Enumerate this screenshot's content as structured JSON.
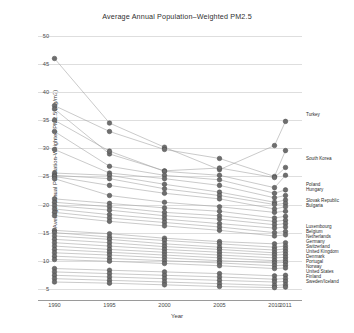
{
  "chart_data": {
    "type": "line",
    "title": "Average Annual Population–Weighted PM2.5",
    "xlabel": "Year",
    "ylabel": "Average Annual Population-Weighted PM2.5 (ug/m3)",
    "x": [
      1990,
      1995,
      2000,
      2005,
      2010,
      2011
    ],
    "xtick_labels": [
      "1990",
      "1995",
      "2000",
      "2005",
      "2010",
      "2011"
    ],
    "ytick_labels": [
      "5",
      "10",
      "15",
      "20",
      "25",
      "30",
      "35",
      "40",
      "45",
      "50"
    ],
    "ylim": [
      3,
      50
    ],
    "xlim": [
      1988.5,
      2012.5
    ],
    "grid": true,
    "legend_position": "right-inline-labels",
    "marker": "filled-circle",
    "marker_color": "#6e6e6e",
    "line_color": "#9e9e9e",
    "series": [
      {
        "name": "Turkey",
        "label": "Turkey",
        "values": [
          46.0,
          34.5,
          30.2,
          26.2,
          30.5,
          34.8
        ]
      },
      {
        "name": "South Korea",
        "label": "South Korea",
        "values": [
          37.6,
          33.0,
          29.8,
          28.2,
          25.0,
          29.6
        ]
      },
      {
        "name": "Poland",
        "label": "Poland",
        "values": [
          37.0,
          29.0,
          26.0,
          26.5,
          24.8,
          26.6
        ]
      },
      {
        "name": "Hungary",
        "label": "Hungary",
        "values": [
          35.0,
          29.5,
          25.9,
          25.2,
          23.0,
          25.2
        ]
      },
      {
        "name": "Slovak Republic",
        "label": "Slovak Republic",
        "values": [
          33.0,
          26.8,
          25.2,
          24.4,
          22.0,
          22.6
        ]
      },
      {
        "name": "Bulgaria",
        "label": "Bulgaria",
        "values": [
          29.8,
          25.6,
          24.6,
          23.4,
          21.2,
          21.6
        ]
      },
      {
        "name": "Czech Republic",
        "label": "",
        "values": [
          25.6,
          25.2,
          23.6,
          22.2,
          20.4,
          20.8
        ]
      },
      {
        "name": "Greece",
        "label": "",
        "values": [
          25.2,
          24.6,
          22.8,
          21.6,
          20.0,
          20.2
        ]
      },
      {
        "name": "Italy",
        "label": "",
        "values": [
          25.0,
          23.4,
          22.0,
          21.0,
          19.2,
          19.6
        ]
      },
      {
        "name": "Romania",
        "label": "",
        "values": [
          24.6,
          21.6,
          20.4,
          19.6,
          18.6,
          18.8
        ]
      },
      {
        "name": "Slovenia",
        "label": "",
        "values": [
          21.0,
          20.2,
          19.4,
          18.8,
          17.6,
          17.9
        ]
      },
      {
        "name": "Austria",
        "label": "",
        "values": [
          20.4,
          19.6,
          18.6,
          18.0,
          17.0,
          17.2
        ]
      },
      {
        "name": "Israel",
        "label": "",
        "values": [
          19.8,
          19.0,
          18.0,
          17.4,
          16.4,
          16.6
        ]
      },
      {
        "name": "France",
        "label": "",
        "values": [
          19.2,
          18.2,
          17.4,
          16.6,
          15.8,
          16.0
        ]
      },
      {
        "name": "Spain",
        "label": "",
        "values": [
          18.6,
          17.6,
          16.8,
          16.0,
          15.0,
          15.2
        ]
      },
      {
        "name": "Chile",
        "label": "",
        "values": [
          18.0,
          17.0,
          16.2,
          15.4,
          14.4,
          14.6
        ]
      },
      {
        "name": "Luxembourg",
        "label": "Luxembourg",
        "values": [
          15.4,
          14.8,
          14.0,
          13.4,
          13.0,
          13.2
        ]
      },
      {
        "name": "Belgium",
        "label": "Belgium",
        "values": [
          15.0,
          14.2,
          13.6,
          13.0,
          12.4,
          12.6
        ]
      },
      {
        "name": "Netherlands",
        "label": "Netherlands",
        "values": [
          14.4,
          13.8,
          13.0,
          12.4,
          11.9,
          12.1
        ]
      },
      {
        "name": "Germany",
        "label": "Germany",
        "values": [
          13.8,
          13.2,
          12.5,
          12.0,
          11.4,
          11.6
        ]
      },
      {
        "name": "Switzerland",
        "label": "Switzerland",
        "values": [
          13.2,
          12.6,
          12.0,
          11.5,
          11.0,
          11.1
        ]
      },
      {
        "name": "United Kingdom",
        "label": "United Kingdom",
        "values": [
          12.6,
          12.0,
          11.5,
          11.0,
          10.5,
          10.6
        ]
      },
      {
        "name": "Denmark",
        "label": "Denmark",
        "values": [
          12.0,
          11.5,
          11.0,
          10.5,
          10.0,
          10.1
        ]
      },
      {
        "name": "Portugal",
        "label": "Portugal",
        "values": [
          11.4,
          11.0,
          10.5,
          10.0,
          9.6,
          9.7
        ]
      },
      {
        "name": "Norway",
        "label": "Norway",
        "values": [
          10.8,
          10.4,
          10.0,
          9.6,
          9.1,
          9.2
        ]
      },
      {
        "name": "United States",
        "label": "United States",
        "values": [
          10.2,
          9.9,
          9.5,
          9.1,
          8.6,
          8.7
        ]
      },
      {
        "name": "Finland",
        "label": "Finland",
        "values": [
          8.6,
          8.3,
          8.0,
          7.7,
          7.3,
          7.4
        ]
      },
      {
        "name": "Sweden/Iceland",
        "label": "Sweden/Iceland",
        "values": [
          8.0,
          7.7,
          7.4,
          7.1,
          6.7,
          6.8
        ]
      },
      {
        "name": "Ireland",
        "label": "",
        "values": [
          7.4,
          7.1,
          6.8,
          6.5,
          6.2,
          6.3
        ]
      },
      {
        "name": "New Zealand",
        "label": "",
        "values": [
          6.8,
          6.5,
          6.2,
          5.9,
          5.6,
          5.7
        ]
      },
      {
        "name": "Australia",
        "label": "",
        "values": [
          6.2,
          6.0,
          5.7,
          5.4,
          5.2,
          5.3
        ]
      }
    ],
    "right_label_groups": [
      {
        "id": "turkey",
        "top": 112,
        "items": [
          "Turkey"
        ]
      },
      {
        "id": "korea",
        "top": 156,
        "items": [
          "South Korea"
        ]
      },
      {
        "id": "poland",
        "top": 182,
        "items": [
          "Poland",
          "Hungary"
        ]
      },
      {
        "id": "slovak",
        "top": 198,
        "items": [
          "Slovak Republic",
          "Bulgaria"
        ]
      },
      {
        "id": "western",
        "top": 224,
        "items": [
          "Luxembourg",
          "Belgium",
          "Netherlands",
          "Germany",
          "Switzerland",
          "United Kingdom",
          "Denmark",
          "Portugal",
          "Norway",
          "United States",
          "Finland",
          "Sweden/Iceland"
        ]
      }
    ]
  }
}
